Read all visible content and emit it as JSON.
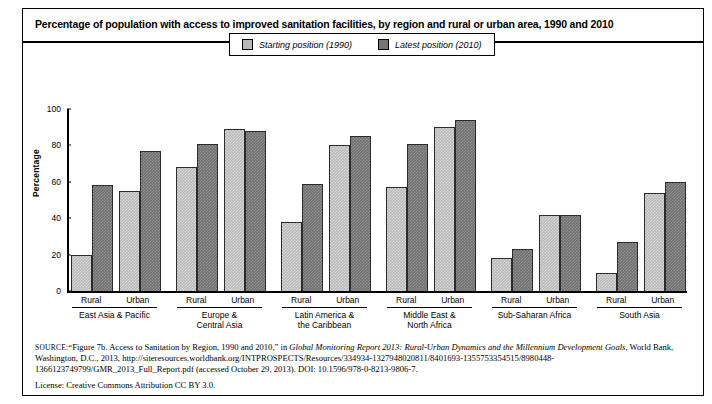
{
  "chart_title": "Percentage of population with access to improved sanitation facilities, by region and rural or urban area, 1990 and 2010",
  "legend": {
    "entries": [
      {
        "label": "Starting position (1990)",
        "color": "#b8b8b8",
        "icon": "square-swatch-light"
      },
      {
        "label": "Latest position (2010)",
        "color": "#6f6f6f",
        "icon": "square-swatch-dark"
      }
    ]
  },
  "axes": {
    "y_title": "Percentage",
    "y_ticks": [
      "0",
      "20",
      "40",
      "60",
      "80",
      "100"
    ]
  },
  "source": {
    "label": "SOURCE:",
    "text_1": "“Figure 7b. Access to Sanitation by Region, 1990 and 2010,” in ",
    "italic_1": "Global Monitoring Report 2013: Rural-Urban Dynamics and the Millennium Development Goals",
    "text_2": ", World Bank, Washington, D.C., 2013, http://siteresources.worldbank.org/INTPROSPECTS/Resources/334934-1327948020811/8401693-1355753354515/8980448-1366123749799/GMR_2013_Full_Report.pdf (accessed October 29, 2013). DOI: 10.1596/978-0-8213-9806-7.",
    "license": "License: Creative Commons Attribution CC BY 3.0."
  },
  "chart_data": {
    "type": "bar",
    "title": "Percentage of population with access to improved sanitation facilities, by region and rural or urban area, 1990 and 2010",
    "xlabel": "",
    "ylabel": "Percentage",
    "ylim": [
      0,
      100
    ],
    "ytick_step": 20,
    "grid": false,
    "legend_position": "top-center",
    "categories": [
      "East Asia & Pacific — Rural",
      "East Asia & Pacific — Urban",
      "Europe & Central Asia — Rural",
      "Europe & Central Asia — Urban",
      "Latin America & the Caribbean — Rural",
      "Latin America & the Caribbean — Urban",
      "Middle East & North Africa — Rural",
      "Middle East & North Africa — Urban",
      "Sub-Saharan Africa — Rural",
      "Sub-Saharan Africa — Urban",
      "South Asia — Rural",
      "South Asia — Urban"
    ],
    "series": [
      {
        "name": "Starting position (1990)",
        "color": "#b8b8b8",
        "values": [
          20,
          55,
          68,
          89,
          38,
          80,
          57,
          90,
          18,
          42,
          10,
          54
        ]
      },
      {
        "name": "Latest position (2010)",
        "color": "#6f6f6f",
        "values": [
          58,
          77,
          81,
          88,
          59,
          85,
          81,
          94,
          23,
          42,
          27,
          60
        ]
      }
    ],
    "groups": [
      {
        "name": "East Asia & Pacific",
        "name_lines": [
          "East Asia & Pacific"
        ],
        "subgroups": [
          {
            "label": "Rural",
            "start": 20,
            "latest": 58
          },
          {
            "label": "Urban",
            "start": 55,
            "latest": 77
          }
        ]
      },
      {
        "name": "Europe & Central Asia",
        "name_lines": [
          "Europe &",
          "Central Asia"
        ],
        "subgroups": [
          {
            "label": "Rural",
            "start": 68,
            "latest": 81
          },
          {
            "label": "Urban",
            "start": 89,
            "latest": 88
          }
        ]
      },
      {
        "name": "Latin America & the Caribbean",
        "name_lines": [
          "Latin America &",
          "the Caribbean"
        ],
        "subgroups": [
          {
            "label": "Rural",
            "start": 38,
            "latest": 59
          },
          {
            "label": "Urban",
            "start": 80,
            "latest": 85
          }
        ]
      },
      {
        "name": "Middle East & North Africa",
        "name_lines": [
          "Middle East &",
          "North Africa"
        ],
        "subgroups": [
          {
            "label": "Rural",
            "start": 57,
            "latest": 81
          },
          {
            "label": "Urban",
            "start": 90,
            "latest": 94
          }
        ]
      },
      {
        "name": "Sub-Saharan Africa",
        "name_lines": [
          "Sub-Saharan Africa"
        ],
        "subgroups": [
          {
            "label": "Rural",
            "start": 18,
            "latest": 23
          },
          {
            "label": "Urban",
            "start": 42,
            "latest": 42
          }
        ]
      },
      {
        "name": "South Asia",
        "name_lines": [
          "South Asia"
        ],
        "subgroups": [
          {
            "label": "Rural",
            "start": 10,
            "latest": 27
          },
          {
            "label": "Urban",
            "start": 54,
            "latest": 60
          }
        ]
      }
    ]
  }
}
